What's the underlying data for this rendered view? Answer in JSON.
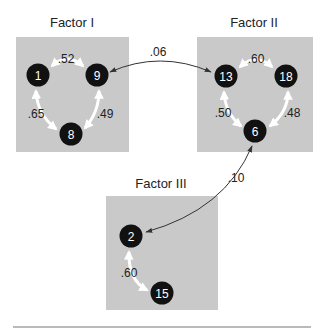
{
  "colors": {
    "box_fill": "#c9c9c9",
    "node_fill": "#111111",
    "node_text": "#ffffff",
    "inner_arrow": "#ffffff",
    "cross_arrow": "#333333",
    "rule": "#777777"
  },
  "factors": [
    {
      "title": "Factor I",
      "box": {
        "x": 16,
        "y": 37,
        "w": 113,
        "h": 115
      },
      "title_pos": {
        "x": 72,
        "y": 27
      },
      "nodes": [
        {
          "id": "1",
          "x": 38,
          "y": 75
        },
        {
          "id": "9",
          "x": 97,
          "y": 75
        },
        {
          "id": "8",
          "x": 71,
          "y": 134
        }
      ],
      "edges": [
        {
          "from": "1",
          "to": "9",
          "label": ".52",
          "lx": 66,
          "ly": 63
        },
        {
          "from": "9",
          "to": "8",
          "label": ".49",
          "lx": 105,
          "ly": 118
        },
        {
          "from": "1",
          "to": "8",
          "label": ".65",
          "lx": 36,
          "ly": 118
        }
      ]
    },
    {
      "title": "Factor II",
      "box": {
        "x": 197,
        "y": 37,
        "w": 116,
        "h": 115
      },
      "title_pos": {
        "x": 254,
        "y": 27
      },
      "nodes": [
        {
          "id": "13",
          "x": 226,
          "y": 76
        },
        {
          "id": "18",
          "x": 286,
          "y": 76
        },
        {
          "id": "6",
          "x": 255,
          "y": 131
        }
      ],
      "edges": [
        {
          "from": "13",
          "to": "18",
          "label": ".60",
          "lx": 256,
          "ly": 63
        },
        {
          "from": "18",
          "to": "6",
          "label": ".48",
          "lx": 292,
          "ly": 117
        },
        {
          "from": "13",
          "to": "6",
          "label": ".50",
          "lx": 223,
          "ly": 117
        }
      ]
    },
    {
      "title": "Factor III",
      "box": {
        "x": 106,
        "y": 196,
        "w": 112,
        "h": 114
      },
      "title_pos": {
        "x": 161,
        "y": 188
      },
      "nodes": [
        {
          "id": "2",
          "x": 131,
          "y": 236
        },
        {
          "id": "15",
          "x": 162,
          "y": 293
        }
      ],
      "edges": [
        {
          "from": "2",
          "to": "15",
          "label": ".60",
          "lx": 129,
          "ly": 277
        }
      ]
    }
  ],
  "cross_links": [
    {
      "from": "9",
      "to": "13",
      "label": ".06",
      "lx": 158,
      "ly": 56
    },
    {
      "from": "6",
      "to": "2",
      "label": ".10",
      "lx": 236,
      "ly": 182
    }
  ]
}
